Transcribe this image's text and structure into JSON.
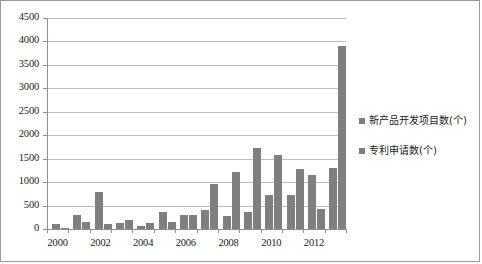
{
  "chart_data": {
    "type": "bar",
    "title": "",
    "xlabel": "",
    "ylabel": "",
    "ylim": [
      0,
      4500
    ],
    "ytick_step": 500,
    "yticks": [
      0,
      500,
      1000,
      1500,
      2000,
      2500,
      3000,
      3500,
      4000,
      4500
    ],
    "ytick_labels": [
      "0",
      "500",
      "1000",
      "1500",
      "2000",
      "2500",
      "3000",
      "3500",
      "4000",
      "4500"
    ],
    "grid": true,
    "legend_position": "right",
    "categories": [
      "2000",
      "2001",
      "2002",
      "2003",
      "2004",
      "2005",
      "2006",
      "2007",
      "2008",
      "2009",
      "2010",
      "2011",
      "2012",
      "2013"
    ],
    "xtick_labels_shown": [
      "2000",
      "2002",
      "2004",
      "2006",
      "2008",
      "2010",
      "2012"
    ],
    "series": [
      {
        "name": "新产品开发项目数(个)",
        "color": "#7f7f7f",
        "values": [
          110,
          300,
          780,
          130,
          65,
          360,
          290,
          410,
          270,
          360,
          730,
          735,
          1160,
          1300
        ]
      },
      {
        "name": "专利申请数(个)",
        "color": "#7f7f7f",
        "values": [
          30,
          155,
          105,
          185,
          120,
          155,
          290,
          965,
          1215,
          1720,
          1585,
          1270,
          420,
          3910
        ]
      }
    ]
  },
  "legend": {
    "items": [
      {
        "label": "新产品开发项目数(个)",
        "color": "#7f7f7f"
      },
      {
        "label": "专利申请数(个)",
        "color": "#7f7f7f"
      }
    ]
  },
  "colors": {
    "bar": "#7f7f7f",
    "gridline": "#bdbdbd",
    "axis": "#8f8f8f",
    "border": "#9a9a9a",
    "text": "#1a1a1a"
  }
}
